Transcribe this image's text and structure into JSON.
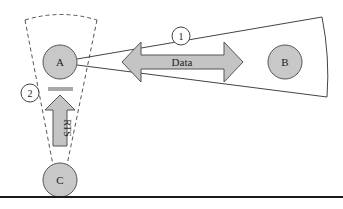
{
  "diagram": {
    "nodes": [
      {
        "id": "A",
        "label": "A"
      },
      {
        "id": "B",
        "label": "B"
      },
      {
        "id": "C",
        "label": "C"
      }
    ],
    "arrows": {
      "data": {
        "label": "Data",
        "direction": "bidirectional",
        "between": [
          "A",
          "B"
        ]
      },
      "rts": {
        "label": "RTS",
        "direction": "up",
        "from": "C",
        "to": "A"
      }
    },
    "markers": [
      {
        "id": "marker-1",
        "label": "1"
      },
      {
        "id": "marker-2",
        "label": "2"
      }
    ],
    "regions": {
      "beam_a_to_b": {
        "style": "solid",
        "description": "directional beam from A covering B"
      },
      "beam_c_to_a": {
        "style": "dashed",
        "description": "directional beam from C covering A"
      }
    },
    "colors": {
      "node_fill": "#c8c8c8",
      "arrow_fill": "#c4c4c4",
      "stroke": "#555555",
      "background": "#ffffff",
      "rule": "#1a1a1a"
    }
  }
}
